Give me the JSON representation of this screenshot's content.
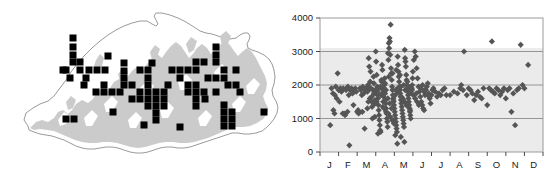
{
  "figure": {
    "background_color": "#ffffff",
    "panels": [
      "distribution-map",
      "elevation-scatter"
    ]
  },
  "map": {
    "name": "bhutan-distribution-map",
    "country_outline_color": "#8c8c8c",
    "terrain_fill_color": "#cccccc",
    "record_marker_color": "#000000",
    "record_marker_shape": "square",
    "record_marker_size_px": 7,
    "record_count": 86,
    "records": [
      [
        73,
        47
      ],
      [
        73,
        55
      ],
      [
        80,
        62
      ],
      [
        73,
        62
      ],
      [
        66,
        70
      ],
      [
        80,
        70
      ],
      [
        89,
        70
      ],
      [
        97,
        70
      ],
      [
        105,
        70
      ],
      [
        63,
        70
      ],
      [
        70,
        78
      ],
      [
        86,
        78
      ],
      [
        104,
        85
      ],
      [
        96,
        92
      ],
      [
        104,
        92
      ],
      [
        112,
        92
      ],
      [
        120,
        92
      ],
      [
        124,
        71
      ],
      [
        124,
        78
      ],
      [
        124,
        85
      ],
      [
        140,
        70
      ],
      [
        148,
        70
      ],
      [
        148,
        78
      ],
      [
        148,
        85
      ],
      [
        148,
        92
      ],
      [
        156,
        92
      ],
      [
        164,
        92
      ],
      [
        140,
        92
      ],
      [
        132,
        99
      ],
      [
        140,
        99
      ],
      [
        148,
        99
      ],
      [
        156,
        99
      ],
      [
        164,
        99
      ],
      [
        148,
        106
      ],
      [
        156,
        106
      ],
      [
        164,
        106
      ],
      [
        156,
        113
      ],
      [
        156,
        120
      ],
      [
        172,
        70
      ],
      [
        180,
        78
      ],
      [
        188,
        85
      ],
      [
        196,
        85
      ],
      [
        188,
        92
      ],
      [
        196,
        92
      ],
      [
        204,
        92
      ],
      [
        196,
        99
      ],
      [
        196,
        106
      ],
      [
        196,
        62
      ],
      [
        204,
        62
      ],
      [
        216,
        47
      ],
      [
        216,
        55
      ],
      [
        216,
        62
      ],
      [
        224,
        70
      ],
      [
        216,
        78
      ],
      [
        224,
        78
      ],
      [
        208,
        78
      ],
      [
        228,
        85
      ],
      [
        236,
        85
      ],
      [
        224,
        105
      ],
      [
        224,
        112
      ],
      [
        224,
        119
      ],
      [
        232,
        112
      ],
      [
        232,
        119
      ],
      [
        224,
        126
      ],
      [
        232,
        126
      ],
      [
        264,
        112
      ],
      [
        66,
        119
      ],
      [
        74,
        119
      ],
      [
        144,
        125
      ],
      [
        180,
        127
      ],
      [
        113,
        112
      ],
      [
        108,
        56
      ],
      [
        73,
        38
      ],
      [
        124,
        63
      ],
      [
        196,
        70
      ],
      [
        205,
        99
      ],
      [
        236,
        70
      ],
      [
        84,
        85
      ],
      [
        132,
        85
      ],
      [
        216,
        92
      ],
      [
        180,
        70
      ],
      [
        188,
        70
      ],
      [
        240,
        92
      ],
      [
        152,
        63
      ],
      [
        168,
        85
      ]
    ]
  },
  "chart_data": {
    "type": "scatter",
    "name": "elevation-by-month-scatter",
    "title": "",
    "xlabel": "",
    "ylabel": "",
    "xlim": [
      0,
      12
    ],
    "ylim": [
      0,
      4000
    ],
    "ytick_labels": [
      "0",
      "1000",
      "2000",
      "3000",
      "4000"
    ],
    "ytick_values": [
      0,
      1000,
      2000,
      3000,
      4000
    ],
    "xtick_labels": [
      "J",
      "F",
      "M",
      "A",
      "M",
      "J",
      "J",
      "A",
      "S",
      "O",
      "N",
      "D"
    ],
    "gridlines": [
      1000,
      2000,
      3000
    ],
    "grid_color": "#808080",
    "plot_bg_color": "#ebebeb",
    "plot_bg_upper_color": "#ffffff",
    "plot_bg_split_value": 3100,
    "frame_color": "#999999",
    "marker_color": "#555555",
    "marker_shape": "diamond",
    "marker_size_px": 5,
    "point_count": 290,
    "points": [
      [
        0.55,
        800
      ],
      [
        0.62,
        1900
      ],
      [
        0.7,
        1750
      ],
      [
        0.72,
        1250
      ],
      [
        0.78,
        1150
      ],
      [
        0.8,
        1700
      ],
      [
        0.85,
        1950
      ],
      [
        0.9,
        1600
      ],
      [
        0.95,
        2350
      ],
      [
        1.0,
        1850
      ],
      [
        1.05,
        1500
      ],
      [
        1.1,
        1900
      ],
      [
        1.15,
        1800
      ],
      [
        1.2,
        1850
      ],
      [
        1.25,
        1900
      ],
      [
        1.3,
        1150
      ],
      [
        1.35,
        1100
      ],
      [
        1.4,
        1850
      ],
      [
        1.45,
        1900
      ],
      [
        1.5,
        1950
      ],
      [
        1.55,
        1700
      ],
      [
        1.58,
        200
      ],
      [
        1.62,
        1850
      ],
      [
        1.7,
        1900
      ],
      [
        1.75,
        1750
      ],
      [
        1.8,
        1400
      ],
      [
        1.85,
        1850
      ],
      [
        1.9,
        1900
      ],
      [
        1.95,
        1800
      ],
      [
        2.0,
        1200
      ],
      [
        2.05,
        1250
      ],
      [
        2.1,
        1200
      ],
      [
        2.15,
        1900
      ],
      [
        2.2,
        1850
      ],
      [
        2.25,
        1700
      ],
      [
        2.3,
        1950
      ],
      [
        2.35,
        1750
      ],
      [
        2.4,
        700
      ],
      [
        2.45,
        1850
      ],
      [
        2.5,
        1900
      ],
      [
        2.55,
        1300
      ],
      [
        2.6,
        1500
      ],
      [
        2.62,
        2800
      ],
      [
        2.65,
        2550
      ],
      [
        2.7,
        2100
      ],
      [
        2.72,
        2400
      ],
      [
        2.75,
        1900
      ],
      [
        2.78,
        1650
      ],
      [
        2.8,
        1350
      ],
      [
        2.82,
        1000
      ],
      [
        2.85,
        1850
      ],
      [
        2.88,
        2250
      ],
      [
        2.9,
        2050
      ],
      [
        2.92,
        1450
      ],
      [
        2.95,
        1550
      ],
      [
        2.97,
        1750
      ],
      [
        3.0,
        3000
      ],
      [
        3.02,
        2700
      ],
      [
        3.05,
        2300
      ],
      [
        3.08,
        1950
      ],
      [
        3.1,
        1800
      ],
      [
        3.12,
        1600
      ],
      [
        3.14,
        1400
      ],
      [
        3.16,
        1250
      ],
      [
        3.18,
        1100
      ],
      [
        3.2,
        950
      ],
      [
        3.22,
        800
      ],
      [
        3.24,
        650
      ],
      [
        3.26,
        600
      ],
      [
        3.28,
        1700
      ],
      [
        3.3,
        1900
      ],
      [
        3.32,
        2100
      ],
      [
        3.34,
        2600
      ],
      [
        3.36,
        2450
      ],
      [
        3.38,
        1350
      ],
      [
        3.4,
        1500
      ],
      [
        3.42,
        1650
      ],
      [
        3.44,
        1850
      ],
      [
        3.46,
        2000
      ],
      [
        3.48,
        2200
      ],
      [
        3.5,
        1750
      ],
      [
        3.52,
        1550
      ],
      [
        3.54,
        1450
      ],
      [
        3.56,
        1300
      ],
      [
        3.58,
        1150
      ],
      [
        3.6,
        1000
      ],
      [
        3.62,
        900
      ],
      [
        3.64,
        750
      ],
      [
        3.66,
        2950
      ],
      [
        3.68,
        2750
      ],
      [
        3.7,
        3250
      ],
      [
        3.72,
        3100
      ],
      [
        3.74,
        3400
      ],
      [
        3.76,
        3300
      ],
      [
        3.78,
        2900
      ],
      [
        3.8,
        3800
      ],
      [
        3.82,
        2500
      ],
      [
        3.84,
        2350
      ],
      [
        3.86,
        2150
      ],
      [
        3.88,
        1950
      ],
      [
        3.9,
        1850
      ],
      [
        3.92,
        1700
      ],
      [
        3.94,
        1600
      ],
      [
        3.96,
        1500
      ],
      [
        3.98,
        1400
      ],
      [
        4.0,
        1300
      ],
      [
        4.02,
        1200
      ],
      [
        4.04,
        1100
      ],
      [
        4.06,
        1000
      ],
      [
        4.08,
        900
      ],
      [
        4.1,
        800
      ],
      [
        4.12,
        700
      ],
      [
        4.14,
        600
      ],
      [
        4.16,
        250
      ],
      [
        4.18,
        2850
      ],
      [
        4.2,
        2600
      ],
      [
        4.22,
        2400
      ],
      [
        4.24,
        2250
      ],
      [
        4.26,
        2100
      ],
      [
        4.28,
        1950
      ],
      [
        4.3,
        1850
      ],
      [
        4.32,
        1750
      ],
      [
        4.34,
        1650
      ],
      [
        4.36,
        1550
      ],
      [
        4.38,
        1450
      ],
      [
        4.4,
        1350
      ],
      [
        4.42,
        1250
      ],
      [
        4.44,
        1150
      ],
      [
        4.46,
        1050
      ],
      [
        4.48,
        950
      ],
      [
        4.5,
        850
      ],
      [
        4.52,
        750
      ],
      [
        4.54,
        300
      ],
      [
        4.56,
        3050
      ],
      [
        4.58,
        2800
      ],
      [
        4.6,
        2700
      ],
      [
        4.62,
        2550
      ],
      [
        4.64,
        2300
      ],
      [
        4.66,
        2150
      ],
      [
        4.68,
        2000
      ],
      [
        4.7,
        1900
      ],
      [
        4.72,
        1800
      ],
      [
        4.74,
        1700
      ],
      [
        4.76,
        1600
      ],
      [
        4.78,
        1500
      ],
      [
        4.8,
        1400
      ],
      [
        4.82,
        1300
      ],
      [
        4.84,
        1200
      ],
      [
        4.86,
        1100
      ],
      [
        4.88,
        1000
      ],
      [
        4.9,
        1750
      ],
      [
        4.92,
        1850
      ],
      [
        4.94,
        1900
      ],
      [
        4.96,
        2000
      ],
      [
        4.98,
        2200
      ],
      [
        5.0,
        2400
      ],
      [
        5.05,
        2750
      ],
      [
        5.1,
        3000
      ],
      [
        5.15,
        2850
      ],
      [
        5.2,
        2500
      ],
      [
        5.25,
        2200
      ],
      [
        5.3,
        1950
      ],
      [
        5.35,
        1800
      ],
      [
        5.4,
        1650
      ],
      [
        5.45,
        1500
      ],
      [
        5.5,
        1400
      ],
      [
        5.55,
        1300
      ],
      [
        5.6,
        1250
      ],
      [
        5.65,
        1700
      ],
      [
        5.7,
        1850
      ],
      [
        5.75,
        1950
      ],
      [
        5.8,
        2050
      ],
      [
        5.85,
        1750
      ],
      [
        5.9,
        1600
      ],
      [
        5.95,
        1450
      ],
      [
        6.0,
        1700
      ],
      [
        6.1,
        1900
      ],
      [
        6.2,
        1800
      ],
      [
        6.3,
        1650
      ],
      [
        6.4,
        1750
      ],
      [
        6.5,
        1700
      ],
      [
        6.6,
        1850
      ],
      [
        6.7,
        1900
      ],
      [
        6.8,
        1700
      ],
      [
        7.0,
        1700
      ],
      [
        7.2,
        1800
      ],
      [
        7.4,
        1750
      ],
      [
        7.55,
        1900
      ],
      [
        7.6,
        2000
      ],
      [
        7.7,
        1850
      ],
      [
        7.75,
        3000
      ],
      [
        7.9,
        1700
      ],
      [
        8.0,
        1900
      ],
      [
        8.1,
        1850
      ],
      [
        8.2,
        1750
      ],
      [
        8.3,
        1550
      ],
      [
        8.4,
        1700
      ],
      [
        8.5,
        1800
      ],
      [
        8.6,
        1650
      ],
      [
        8.7,
        1600
      ],
      [
        8.8,
        1900
      ],
      [
        9.0,
        1400
      ],
      [
        9.1,
        1900
      ],
      [
        9.2,
        1850
      ],
      [
        9.25,
        3300
      ],
      [
        9.3,
        1800
      ],
      [
        9.4,
        1750
      ],
      [
        9.5,
        1900
      ],
      [
        9.6,
        1850
      ],
      [
        9.7,
        1700
      ],
      [
        9.8,
        1800
      ],
      [
        9.9,
        1900
      ],
      [
        10.0,
        1600
      ],
      [
        10.1,
        1850
      ],
      [
        10.2,
        1900
      ],
      [
        10.3,
        1200
      ],
      [
        10.4,
        1750
      ],
      [
        10.5,
        800
      ],
      [
        10.6,
        1850
      ],
      [
        10.7,
        1900
      ],
      [
        10.8,
        3200
      ],
      [
        10.9,
        2000
      ],
      [
        11.0,
        1900
      ],
      [
        11.2,
        2600
      ],
      [
        2.5,
        1900
      ],
      [
        2.55,
        1800
      ],
      [
        2.58,
        2000
      ],
      [
        3.05,
        1500
      ],
      [
        3.35,
        1750
      ],
      [
        3.45,
        1900
      ],
      [
        3.55,
        1850
      ],
      [
        3.65,
        1600
      ],
      [
        3.75,
        1450
      ],
      [
        3.85,
        1300
      ],
      [
        3.95,
        1550
      ],
      [
        4.05,
        1700
      ],
      [
        4.15,
        1800
      ],
      [
        4.25,
        1900
      ],
      [
        4.35,
        1950
      ],
      [
        4.45,
        1600
      ],
      [
        4.55,
        1500
      ],
      [
        4.65,
        1400
      ],
      [
        4.75,
        1350
      ],
      [
        4.85,
        1250
      ],
      [
        4.95,
        1850
      ],
      [
        5.02,
        1700
      ],
      [
        5.12,
        1600
      ],
      [
        5.22,
        1500
      ],
      [
        5.32,
        1400
      ],
      [
        5.42,
        1900
      ],
      [
        5.52,
        2000
      ],
      [
        5.62,
        1850
      ],
      [
        2.68,
        1600
      ],
      [
        2.78,
        1500
      ],
      [
        2.88,
        1400
      ],
      [
        2.98,
        1850
      ],
      [
        3.15,
        1900
      ],
      [
        3.25,
        1950
      ],
      [
        3.45,
        1300
      ],
      [
        3.55,
        1200
      ],
      [
        3.68,
        1150
      ],
      [
        3.78,
        1050
      ],
      [
        3.88,
        950
      ],
      [
        3.98,
        850
      ],
      [
        4.08,
        1850
      ],
      [
        4.18,
        1900
      ],
      [
        4.28,
        1750
      ],
      [
        4.38,
        1650
      ],
      [
        4.48,
        1550
      ],
      [
        4.58,
        1850
      ],
      [
        4.68,
        1900
      ],
      [
        4.78,
        1950
      ],
      [
        2.6,
        1850
      ],
      [
        2.7,
        1900
      ],
      [
        2.9,
        1750
      ],
      [
        3.1,
        1700
      ],
      [
        3.3,
        2150
      ],
      [
        3.5,
        2050
      ],
      [
        3.7,
        2250
      ],
      [
        3.9,
        2350
      ],
      [
        4.1,
        2450
      ],
      [
        4.3,
        2300
      ],
      [
        4.5,
        2000
      ],
      [
        4.7,
        2100
      ],
      [
        5.6,
        1800
      ],
      [
        5.8,
        1700
      ],
      [
        6.05,
        1850
      ],
      [
        1.22,
        1150
      ],
      [
        1.48,
        1200
      ],
      [
        2.08,
        1150
      ],
      [
        2.28,
        1200
      ],
      [
        5.18,
        1750
      ],
      [
        4.05,
        500
      ],
      [
        4.35,
        450
      ],
      [
        3.12,
        550
      ],
      [
        2.95,
        1050
      ]
    ]
  }
}
